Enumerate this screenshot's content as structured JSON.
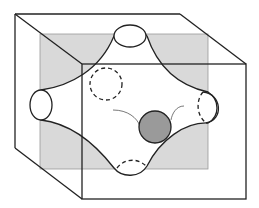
{
  "diagram": {
    "colors": {
      "background": "#ffffff",
      "line": "#222222",
      "plane_fill": "#d9d9d9",
      "plane_edge": "#9a9a9a",
      "surface_fill": "#ffffff",
      "sphere_fill": "#9a9a9a",
      "trail": "#555555"
    },
    "elements": [
      {
        "id": "cube",
        "label": "cube wireframe"
      },
      {
        "id": "mid-plane",
        "label": "gray cross-section plane"
      },
      {
        "id": "saddle-surface",
        "label": "four-neck saddle surface"
      },
      {
        "id": "neck-top",
        "label": "top opening (solid ellipse)"
      },
      {
        "id": "neck-left",
        "label": "left opening (solid ellipse)"
      },
      {
        "id": "neck-right",
        "label": "right opening (partially dashed)"
      },
      {
        "id": "neck-bottom",
        "label": "bottom opening (dashed)"
      },
      {
        "id": "neck-back",
        "label": "back opening (dashed circle)"
      },
      {
        "id": "sphere",
        "label": "gray ball"
      },
      {
        "id": "motion-trails",
        "label": "thin curved trails beside ball"
      }
    ]
  }
}
